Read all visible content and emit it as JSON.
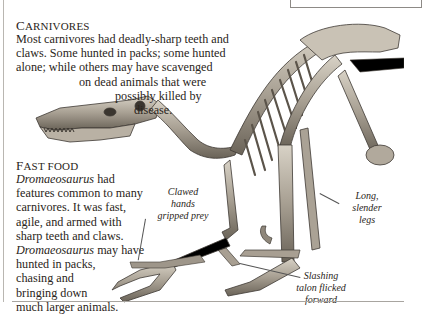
{
  "carnivores": {
    "heading_first": "C",
    "heading_rest": "ARNIVORES",
    "lines": [
      "Most carnivores had deadly-sharp teeth and",
      "claws. Some hunted in packs; some hunted",
      "alone; while others may have scavenged",
      "on dead animals that were",
      "possibly killed by",
      "disease."
    ]
  },
  "fast_food": {
    "heading_first": "F",
    "heading_rest": "AST FOOD",
    "line1_italic": "Dromaeosaurus",
    "line1_rest": " had",
    "lines": [
      "features common to many",
      "carnivores. It was fast,",
      "agile, and armed with",
      "sharp teeth and claws."
    ],
    "line6_italic": "Dromaeosaurus",
    "line6_rest": " may have",
    "lines_end": [
      "hunted in packs,",
      "chasing and",
      "bringing down",
      "much larger animals."
    ]
  },
  "captions": {
    "clawed_hands": [
      "Clawed",
      "hands",
      "gripped prey"
    ],
    "long_legs": [
      "Long,",
      "slender",
      "legs"
    ],
    "slashing_talon": [
      "Slashing",
      "talon flicked",
      "forward"
    ]
  },
  "colors": {
    "bone_light": "#cfc8bb",
    "bone_mid": "#9e968a",
    "bone_dark": "#4a453e",
    "text": "#2a2520"
  }
}
